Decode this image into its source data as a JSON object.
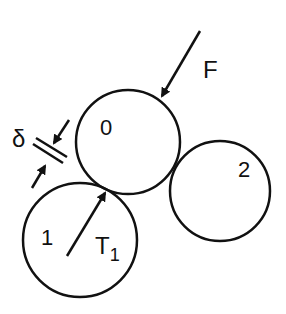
{
  "diagram": {
    "circles": [
      {
        "id": "0",
        "label": "0",
        "cx": 128,
        "cy": 142,
        "r": 52
      },
      {
        "id": "1",
        "label": "1",
        "cx": 80,
        "cy": 240,
        "r": 57
      },
      {
        "id": "2",
        "label": "2",
        "cx": 220,
        "cy": 191,
        "r": 50
      }
    ],
    "labels": {
      "force": "F",
      "gap": "δ",
      "torque_main": "T",
      "torque_sub": "1",
      "circle0": "0",
      "circle1": "1",
      "circle2": "2"
    },
    "colors": {
      "stroke": "#111111",
      "background": "#ffffff"
    }
  }
}
